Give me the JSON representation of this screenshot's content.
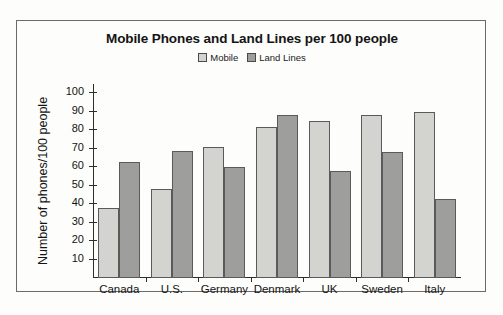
{
  "chart_data": {
    "type": "bar",
    "title": "Mobile Phones and Land Lines per 100 people",
    "xlabel": "",
    "ylabel": "Number of phones/100 people",
    "categories": [
      "Canada",
      "U.S.",
      "Germany",
      "Denmark",
      "UK",
      "Sweden",
      "Italy"
    ],
    "series": [
      {
        "name": "Mobile",
        "values": [
          38,
          48,
          71,
          82,
          85,
          88,
          90
        ],
        "color": "#d3d3d0"
      },
      {
        "name": "Land Lines",
        "values": [
          63,
          69,
          60,
          88,
          58,
          68,
          43
        ],
        "color": "#9e9e9c"
      }
    ],
    "ylim": [
      0,
      105
    ],
    "yticks": [
      10,
      20,
      30,
      40,
      50,
      60,
      70,
      80,
      90,
      100
    ],
    "ytick_labels": [
      "10",
      "20",
      "30",
      "40",
      "50",
      "60",
      "70",
      "80",
      "90",
      "100"
    ],
    "grid": false,
    "legend_position": "top-center"
  },
  "legend": {
    "entries": [
      {
        "label": "Mobile"
      },
      {
        "label": "Land Lines"
      }
    ]
  }
}
